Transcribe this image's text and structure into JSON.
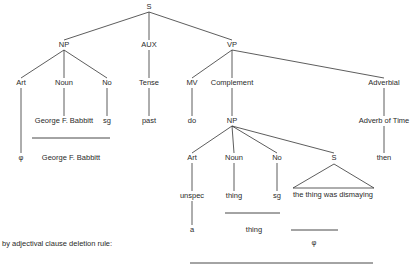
{
  "diagram": {
    "type": "phrase-structure-tree",
    "line_color": "#333333",
    "text_color": "#2a2a2a",
    "nodes": [
      {
        "id": "s_root",
        "label": "S",
        "x": 149,
        "y": 7
      },
      {
        "id": "np1",
        "label": "NP",
        "x": 64,
        "y": 45
      },
      {
        "id": "aux",
        "label": "AUX",
        "x": 149,
        "y": 45
      },
      {
        "id": "vp",
        "label": "VP",
        "x": 232,
        "y": 45
      },
      {
        "id": "art1",
        "label": "Art",
        "x": 21,
        "y": 83
      },
      {
        "id": "noun1",
        "label": "Noun",
        "x": 64,
        "y": 83
      },
      {
        "id": "no1",
        "label": "No",
        "x": 107,
        "y": 83
      },
      {
        "id": "tense",
        "label": "Tense",
        "x": 149,
        "y": 83
      },
      {
        "id": "mv",
        "label": "MV",
        "x": 192,
        "y": 83
      },
      {
        "id": "complement",
        "label": "Complement",
        "x": 232,
        "y": 83
      },
      {
        "id": "adverbial",
        "label": "Adverbial",
        "x": 384,
        "y": 83
      },
      {
        "id": "george1",
        "label": "George F. Babbitt",
        "x": 64,
        "y": 121
      },
      {
        "id": "sg1",
        "label": "sg",
        "x": 107,
        "y": 121
      },
      {
        "id": "past",
        "label": "past",
        "x": 149,
        "y": 121
      },
      {
        "id": "do",
        "label": "do",
        "x": 192,
        "y": 121
      },
      {
        "id": "np2",
        "label": "NP",
        "x": 232,
        "y": 121
      },
      {
        "id": "adverb_time",
        "label": "Adverb of Time",
        "x": 384,
        "y": 121
      },
      {
        "id": "phi1",
        "label": "φ",
        "x": 21,
        "y": 158
      },
      {
        "id": "george2",
        "label": "George F. Babbitt",
        "x": 71,
        "y": 158
      },
      {
        "id": "art2",
        "label": "Art",
        "x": 192,
        "y": 158
      },
      {
        "id": "noun2",
        "label": "Noun",
        "x": 234,
        "y": 158
      },
      {
        "id": "no2",
        "label": "No",
        "x": 277,
        "y": 158
      },
      {
        "id": "s_embedded",
        "label": "S",
        "x": 334,
        "y": 158
      },
      {
        "id": "then",
        "label": "then",
        "x": 384,
        "y": 158
      },
      {
        "id": "unspec",
        "label": "unspec",
        "x": 192,
        "y": 196
      },
      {
        "id": "thing1",
        "label": "thing",
        "x": 234,
        "y": 196
      },
      {
        "id": "sg2",
        "label": "sg",
        "x": 277,
        "y": 196
      },
      {
        "id": "clause",
        "label": "the thing was dismaying",
        "x": 333,
        "y": 195
      },
      {
        "id": "a",
        "label": "a",
        "x": 192,
        "y": 230
      },
      {
        "id": "thing2",
        "label": "thing",
        "x": 254,
        "y": 230
      },
      {
        "id": "phi2",
        "label": "φ",
        "x": 314,
        "y": 243
      }
    ],
    "caption": {
      "label": "by adjectival clause deletion rule:",
      "x": 2,
      "y": 244
    },
    "edges": [
      {
        "x1": 149,
        "y1": 12,
        "x2": 64,
        "y2": 40
      },
      {
        "x1": 149,
        "y1": 12,
        "x2": 149,
        "y2": 40
      },
      {
        "x1": 149,
        "y1": 12,
        "x2": 232,
        "y2": 40
      },
      {
        "x1": 64,
        "y1": 50,
        "x2": 21,
        "y2": 78
      },
      {
        "x1": 64,
        "y1": 50,
        "x2": 64,
        "y2": 78
      },
      {
        "x1": 64,
        "y1": 50,
        "x2": 107,
        "y2": 78
      },
      {
        "x1": 149,
        "y1": 50,
        "x2": 149,
        "y2": 78
      },
      {
        "x1": 232,
        "y1": 50,
        "x2": 192,
        "y2": 78
      },
      {
        "x1": 232,
        "y1": 50,
        "x2": 232,
        "y2": 78
      },
      {
        "x1": 232,
        "y1": 50,
        "x2": 384,
        "y2": 78
      },
      {
        "x1": 64,
        "y1": 88,
        "x2": 64,
        "y2": 116
      },
      {
        "x1": 107,
        "y1": 88,
        "x2": 107,
        "y2": 116
      },
      {
        "x1": 149,
        "y1": 88,
        "x2": 149,
        "y2": 116
      },
      {
        "x1": 192,
        "y1": 88,
        "x2": 192,
        "y2": 116
      },
      {
        "x1": 232,
        "y1": 88,
        "x2": 232,
        "y2": 116
      },
      {
        "x1": 384,
        "y1": 88,
        "x2": 384,
        "y2": 116
      },
      {
        "x1": 21,
        "y1": 88,
        "x2": 21,
        "y2": 153
      },
      {
        "x1": 232,
        "y1": 126,
        "x2": 192,
        "y2": 153
      },
      {
        "x1": 232,
        "y1": 126,
        "x2": 234,
        "y2": 153
      },
      {
        "x1": 232,
        "y1": 126,
        "x2": 277,
        "y2": 153
      },
      {
        "x1": 232,
        "y1": 126,
        "x2": 334,
        "y2": 153
      },
      {
        "x1": 384,
        "y1": 126,
        "x2": 384,
        "y2": 153
      },
      {
        "x1": 192,
        "y1": 163,
        "x2": 192,
        "y2": 191
      },
      {
        "x1": 234,
        "y1": 163,
        "x2": 234,
        "y2": 191
      },
      {
        "x1": 277,
        "y1": 163,
        "x2": 277,
        "y2": 191
      },
      {
        "x1": 192,
        "y1": 201,
        "x2": 192,
        "y2": 225
      }
    ],
    "triangle": {
      "apex_x": 334,
      "apex_y": 164,
      "left_x": 293,
      "right_x": 374,
      "base_y": 188
    },
    "rules": [
      {
        "x1": 32,
        "y1": 138,
        "x2": 110,
        "y2": 138
      },
      {
        "x1": 225,
        "y1": 213,
        "x2": 280,
        "y2": 213
      },
      {
        "x1": 291,
        "y1": 230,
        "x2": 338,
        "y2": 230
      },
      {
        "x1": 190,
        "y1": 263,
        "x2": 373,
        "y2": 263
      }
    ]
  }
}
